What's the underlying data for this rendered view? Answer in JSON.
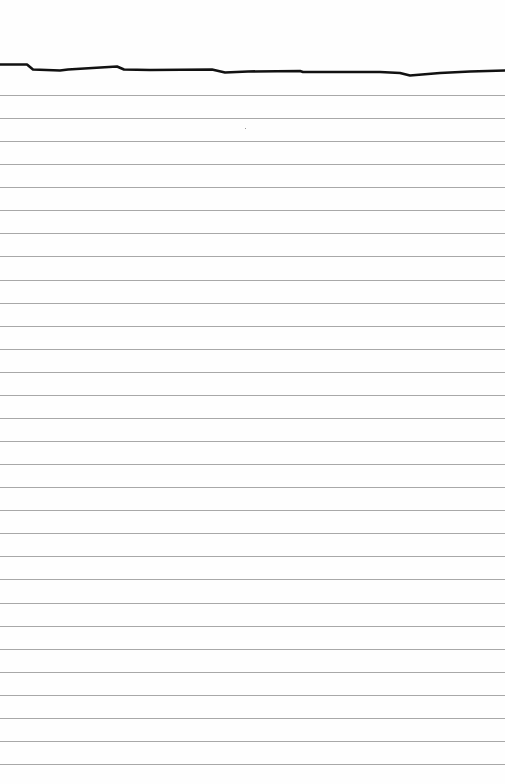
{
  "paper": {
    "type": "lined-notepaper",
    "background_color": "#fefefe",
    "rule_color": "#a8a8a8",
    "header_line_color": "#111111",
    "rule_count": 30,
    "first_rule_y": 95,
    "rule_spacing": 23.07
  }
}
